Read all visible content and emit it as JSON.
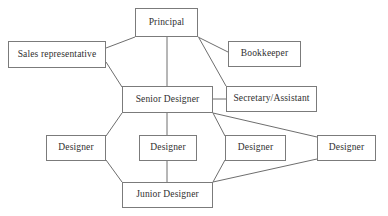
{
  "diagram": {
    "type": "organizational-chart",
    "title": "",
    "style": {
      "background": "#ffffff",
      "box_border": "#7b7b7b",
      "box_fill": "#ffffff",
      "text_color": "#2f2f2f",
      "connector_color": "#6e6e6e"
    },
    "nodes": [
      {
        "id": "principal",
        "label": "Principal",
        "x": 135,
        "y": 8,
        "w": 63,
        "h": 29
      },
      {
        "id": "sales",
        "label": "Sales representative",
        "x": 8,
        "y": 41,
        "w": 98,
        "h": 27
      },
      {
        "id": "bookkeeper",
        "label": "Bookkeeper",
        "x": 228,
        "y": 41,
        "w": 73,
        "h": 26
      },
      {
        "id": "senior",
        "label": "Senior Designer",
        "x": 122,
        "y": 86,
        "w": 91,
        "h": 27
      },
      {
        "id": "secretary",
        "label": "Secretary/Assistant",
        "x": 226,
        "y": 86,
        "w": 91,
        "h": 26
      },
      {
        "id": "designer1",
        "label": "Designer",
        "x": 46,
        "y": 135,
        "w": 60,
        "h": 26
      },
      {
        "id": "designer2",
        "label": "Designer",
        "x": 139,
        "y": 135,
        "w": 58,
        "h": 26
      },
      {
        "id": "designer3",
        "label": "Designer",
        "x": 225,
        "y": 135,
        "w": 61,
        "h": 26
      },
      {
        "id": "designer4",
        "label": "Designer",
        "x": 317,
        "y": 135,
        "w": 59,
        "h": 26
      },
      {
        "id": "junior",
        "label": "Junior Designer",
        "x": 122,
        "y": 182,
        "w": 91,
        "h": 26
      }
    ],
    "connectors": [
      {
        "from": "principal",
        "to": "sales",
        "points": "135,37 106,48"
      },
      {
        "from": "sales",
        "to": "senior",
        "points": "106,62 122,87"
      },
      {
        "from": "principal",
        "to": "senior",
        "points": "167,37 167,87"
      },
      {
        "from": "principal",
        "to": "bookkeeper",
        "points": "198,37 228,52"
      },
      {
        "from": "principal",
        "to": "secretary",
        "points": "199,38 226,86"
      },
      {
        "from": "senior",
        "to": "secretary",
        "points": "213,99 226,99"
      },
      {
        "from": "senior",
        "to": "designer1",
        "points": "122,113 106,136"
      },
      {
        "from": "designer1",
        "to": "junior",
        "points": "106,160 122,182"
      },
      {
        "from": "senior",
        "to": "designer2",
        "points": "167,113 167,135"
      },
      {
        "from": "designer2",
        "to": "junior",
        "points": "167,161 167,182"
      },
      {
        "from": "senior",
        "to": "designer3",
        "points": "213,113 225,136"
      },
      {
        "from": "designer3",
        "to": "junior",
        "points": "225,160 213,182"
      },
      {
        "from": "senior",
        "to": "designer4",
        "points": "213,113 317,137"
      },
      {
        "from": "designer4",
        "to": "junior",
        "points": "317,159 213,182"
      }
    ]
  }
}
